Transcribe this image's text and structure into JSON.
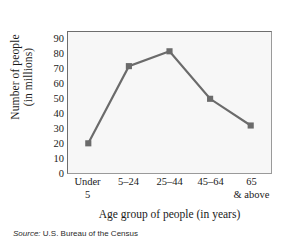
{
  "chart_data": {
    "type": "line",
    "title": "",
    "xlabel": "Age group of people (in years)",
    "ylabel_line1": "Number of people",
    "ylabel_line2": "(in millions)",
    "categories": [
      "Under 5",
      "5–24",
      "25–44",
      "45–64",
      "65 & above"
    ],
    "category_lines": [
      {
        "line1": "Under",
        "line2": "5"
      },
      {
        "line1": "5–24",
        "line2": ""
      },
      {
        "line1": "25–44",
        "line2": ""
      },
      {
        "line1": "45–64",
        "line2": ""
      },
      {
        "line1": "65",
        "line2": "& above"
      }
    ],
    "values": [
      20,
      72,
      82,
      50,
      32
    ],
    "ylim": [
      0,
      95
    ],
    "yticks": [
      0,
      10,
      20,
      30,
      40,
      50,
      60,
      70,
      80,
      90
    ],
    "ytick_labels": [
      "0",
      "10",
      "20",
      "30",
      "40",
      "50",
      "60",
      "70",
      "80",
      "90"
    ],
    "grid": false,
    "legend": "none",
    "series_color": "#6b6b6b",
    "marker": "square",
    "plot_background": "#f7f7f7",
    "frame_color": "#8c8c8c"
  },
  "source": {
    "label": "Source:",
    "text": "U.S. Bureau of the Census"
  }
}
